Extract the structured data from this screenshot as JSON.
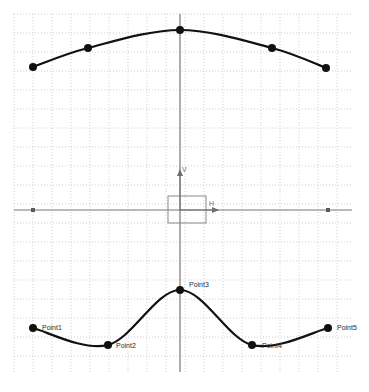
{
  "canvas": {
    "width": 369,
    "height": 392,
    "background": "#ffffff"
  },
  "grid": {
    "minor_color": "#cfcfcf",
    "major_color": "#9a9a9a",
    "axis_color": "#777777",
    "minor_step": 19,
    "major_step": 38,
    "x_start": 14,
    "x_end": 352,
    "y_start": 14,
    "y_end": 372,
    "grid_visible": true
  },
  "origin_widget": {
    "origin_x": 180,
    "origin_y": 210,
    "vertical_axis_label": "V",
    "horizontal_axis_label": "H",
    "square_x": 168,
    "square_y": 196,
    "square_w": 38,
    "square_h": 27,
    "square_color": "#8a8a8a",
    "axis_color": "#6d6d6d",
    "endpoint_dot_left_x": 33,
    "endpoint_dot_right_x": 328,
    "endpoint_dot_y": 210
  },
  "chart_data": {
    "type": "line",
    "title": "",
    "subtitle": "",
    "xlabel": "H",
    "ylabel": "V",
    "grid": true,
    "legend": "none",
    "axis_origin_px": [
      180,
      210
    ],
    "px_per_unit": 19,
    "xlim_px": [
      14,
      352
    ],
    "ylim_px": [
      14,
      372
    ],
    "series": [
      {
        "name": "upper-curve",
        "style": "smooth-spline",
        "color": "#111111",
        "line_width": 2.2,
        "marker": "filled-circle",
        "marker_radius": 4,
        "labels_visible": false,
        "points_px": [
          [
            33,
            67
          ],
          [
            88,
            48
          ],
          [
            180,
            30
          ],
          [
            272,
            48
          ],
          [
            326,
            68
          ]
        ],
        "points_units": [
          [
            -7.74,
            7.53
          ],
          [
            -4.84,
            8.53
          ],
          [
            0.0,
            9.47
          ],
          [
            4.84,
            8.53
          ],
          [
            7.68,
            7.47
          ]
        ]
      },
      {
        "name": "lower-curve",
        "style": "smooth-spline",
        "color": "#111111",
        "line_width": 2.2,
        "marker": "filled-circle",
        "marker_radius": 4,
        "labels_visible": true,
        "points_px": [
          [
            33,
            328
          ],
          [
            108,
            345
          ],
          [
            180,
            290
          ],
          [
            252,
            345
          ],
          [
            328,
            328
          ]
        ],
        "points_units": [
          [
            -7.74,
            -6.21
          ],
          [
            -3.79,
            -7.11
          ],
          [
            0.0,
            -4.21
          ],
          [
            3.79,
            -7.11
          ],
          [
            7.79,
            -6.21
          ]
        ],
        "labels": [
          "Point1",
          "Point2",
          "Point3",
          "Point4",
          "Point5"
        ],
        "label_offsets_px": [
          [
            9,
            2
          ],
          [
            8,
            3
          ],
          [
            9,
            -3
          ],
          [
            10,
            3
          ],
          [
            9,
            2
          ]
        ]
      }
    ]
  }
}
